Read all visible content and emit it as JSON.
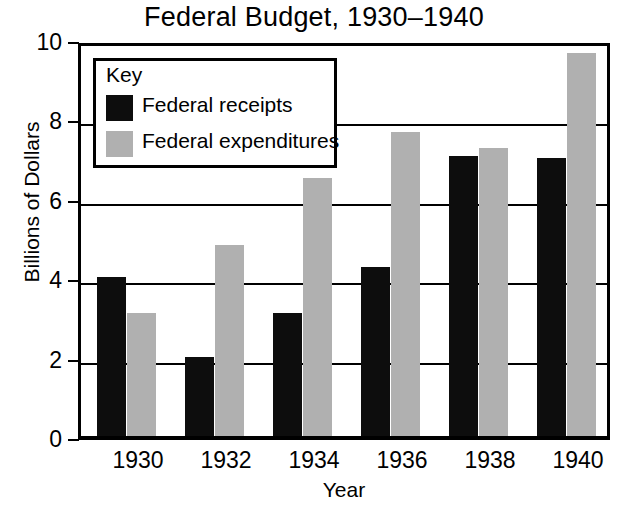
{
  "chart_data": {
    "type": "bar",
    "title": "Federal Budget, 1930–1940",
    "xlabel": "Year",
    "ylabel": "Billions of Dollars",
    "categories": [
      "1930",
      "1932",
      "1934",
      "1936",
      "1938",
      "1940"
    ],
    "series": [
      {
        "name": "Federal receipts",
        "color": "#0d0d0d",
        "values": [
          4.0,
          2.0,
          3.1,
          4.25,
          7.05,
          7.0
        ]
      },
      {
        "name": "Federal expenditures",
        "color": "#b0b0b0",
        "values": [
          3.1,
          4.8,
          6.5,
          7.65,
          7.25,
          9.65
        ]
      }
    ],
    "ylim": [
      0,
      10
    ],
    "y_ticks": [
      "0",
      "2",
      "4",
      "6",
      "8",
      "10"
    ],
    "y_tick_values": [
      0,
      2,
      4,
      6,
      8,
      10
    ],
    "grid": true,
    "legend_position": "top-left"
  },
  "legend": {
    "title": "Key",
    "entries": [
      {
        "label": "Federal receipts",
        "color": "#0d0d0d"
      },
      {
        "label": "Federal expenditures",
        "color": "#b0b0b0"
      }
    ]
  }
}
